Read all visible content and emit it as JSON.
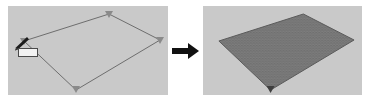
{
  "figure": {
    "name": "surface-mesh-generation-figure",
    "background_color": "#ffffff"
  },
  "panels": [
    {
      "id": "before",
      "name": "panel-before",
      "role": "outlined-surface-boundary",
      "background_color": "#c9c9c9",
      "outline_color": "#6e6e6e",
      "outline_width": 1,
      "shape": {
        "type": "parallelogram-outline",
        "points": "16,35 101,8 152,34 68,84"
      },
      "vertices": [
        {
          "name": "vertex-left",
          "x": 16,
          "y": 35,
          "style": "node-marker"
        },
        {
          "name": "vertex-top",
          "x": 101,
          "y": 8,
          "style": "node-marker"
        },
        {
          "name": "vertex-right",
          "x": 152,
          "y": 34,
          "style": "node-marker"
        },
        {
          "name": "vertex-bottom",
          "x": 68,
          "y": 84,
          "style": "node-marker"
        }
      ],
      "vertex_marker_color": "#8a8a8a"
    },
    {
      "id": "after",
      "name": "panel-after",
      "role": "meshed-surface-result",
      "background_color": "#c9c9c9",
      "fill_color": "#6b6b6b",
      "mesh_color": "#8d8d8d",
      "mesh_cell_size": 2,
      "outline_color": "#5a5a5a",
      "shape": {
        "type": "parallelogram-filled-mesh",
        "points": "16,35 101,8 152,34 68,84"
      }
    }
  ],
  "arrow": {
    "name": "transformation-arrow",
    "direction": "right",
    "color": "#111111"
  },
  "cursor": {
    "name": "pen-tool-cursor",
    "icon": "pen-cursor-icon",
    "body_color": "#1c1c1c",
    "tip_color": "#3a3a3a",
    "tooltip": {
      "name": "cursor-tooltip",
      "label": "",
      "background_color": "#f2f2f2",
      "border_color": "#4a4a4a"
    }
  }
}
